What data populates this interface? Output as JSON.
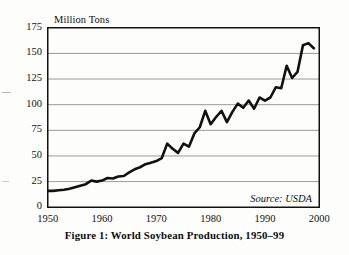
{
  "figure": {
    "caption": "Figure 1: World Soybean Production, 1950–99",
    "source_note": "Source: USDA"
  },
  "chart_data": {
    "type": "line",
    "title": "",
    "xlabel": "",
    "ylabel": "Million Tons",
    "ylim": [
      0,
      175
    ],
    "xlim": [
      1950,
      2000
    ],
    "yticks": [
      0,
      25,
      50,
      75,
      100,
      125,
      150,
      175
    ],
    "xticks": [
      1950,
      1960,
      1970,
      1980,
      1990,
      2000
    ],
    "ytick_labels": [
      "0",
      "25",
      "50",
      "75",
      "100",
      "125",
      "150",
      "175"
    ],
    "xtick_labels": [
      "1950",
      "1960",
      "1970",
      "1980",
      "1990",
      "2000"
    ],
    "grid": "horizontal",
    "legend": "none",
    "line_color": "#111111",
    "line_width": 2.6,
    "x": [
      1950,
      1951,
      1952,
      1953,
      1954,
      1955,
      1956,
      1957,
      1958,
      1959,
      1960,
      1961,
      1962,
      1963,
      1964,
      1965,
      1966,
      1967,
      1968,
      1969,
      1970,
      1971,
      1972,
      1973,
      1974,
      1975,
      1976,
      1977,
      1978,
      1979,
      1980,
      1981,
      1982,
      1983,
      1984,
      1985,
      1986,
      1987,
      1988,
      1989,
      1990,
      1991,
      1992,
      1993,
      1994,
      1995,
      1996,
      1997,
      1998,
      1999
    ],
    "values": [
      16,
      16,
      16.5,
      17,
      18,
      19.5,
      21,
      22.5,
      26,
      25,
      26,
      28.5,
      28,
      30,
      30.5,
      34,
      37,
      39,
      42,
      43.5,
      45,
      48,
      62,
      57,
      53,
      62,
      59,
      72,
      78,
      94,
      81,
      88,
      94,
      83,
      93,
      101,
      97,
      104,
      96,
      107,
      104,
      107,
      117,
      116,
      138,
      126,
      132,
      158,
      160,
      155
    ]
  }
}
